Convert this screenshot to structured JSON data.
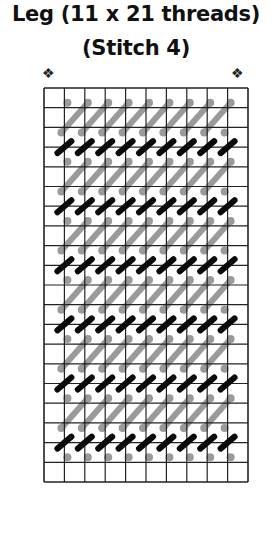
{
  "header": {
    "title_line1": "Leg (11 x 21 threads)",
    "title_line2": "(Stitch 4)"
  },
  "markers": {
    "start_left": "❖",
    "start_right": "❖"
  },
  "grid": {
    "threads_wide": 11,
    "threads_high": 21,
    "cols": 10,
    "rows": 20,
    "left": 44,
    "top": 88,
    "right": 248,
    "bottom": 482,
    "line_color": "#222222"
  },
  "stitches": {
    "black_color": "#0a0a0a",
    "grey_color": "#9a9a9a",
    "black_rows_on_lines": [
      3,
      6,
      9,
      12,
      15,
      18
    ],
    "black_cols_on_lines": [
      1,
      2,
      3,
      4,
      5,
      6,
      7,
      8,
      9
    ],
    "grey_bands_start_line": [
      1,
      4,
      7,
      10,
      13,
      16,
      19
    ],
    "grey_bar_cols": [
      1,
      2,
      3,
      4,
      5,
      6,
      7,
      8
    ]
  }
}
